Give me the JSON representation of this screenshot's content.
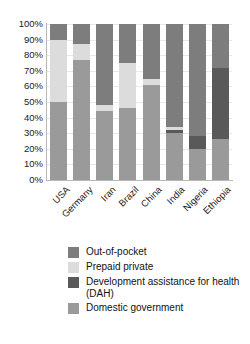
{
  "chart_data": {
    "type": "bar",
    "subtype": "stacked-bar-100",
    "title": "",
    "subtitle": "",
    "xlabel": "",
    "ylabel": "",
    "ylim": [
      0,
      100
    ],
    "yunit": "%",
    "grid": true,
    "legend_position": "bottom-left",
    "categories": [
      "USA",
      "Germany",
      "Iran",
      "Brazil",
      "China",
      "India",
      "Nigeria",
      "Ethiopia"
    ],
    "ytick_labels": [
      "100%",
      "90%",
      "80%",
      "70%",
      "60%",
      "50%",
      "40%",
      "30%",
      "20%",
      "10%",
      "0%"
    ],
    "ytick_values": [
      100,
      90,
      80,
      70,
      60,
      50,
      40,
      30,
      20,
      10,
      0
    ],
    "stack_order_bottom_to_top": [
      "Domestic government",
      "Development assistance for health (DAH)",
      "Prepaid private",
      "Out-of-pocket"
    ],
    "series": [
      {
        "name": "Domestic government",
        "color": "#9a9a9a",
        "values": [
          50,
          77,
          44,
          46,
          61,
          30,
          20,
          26
        ]
      },
      {
        "name": "Development assistance for health (DAH)",
        "color": "#595959",
        "values": [
          0,
          0,
          0,
          0,
          0,
          2,
          8,
          46
        ]
      },
      {
        "name": "Prepaid private",
        "color": "#dcdcdc",
        "values": [
          40,
          10,
          4,
          29,
          4,
          2,
          0,
          0
        ]
      },
      {
        "name": "Out-of-pocket",
        "color": "#7d7d7d",
        "values": [
          10,
          13,
          52,
          25,
          35,
          66,
          72,
          28
        ]
      }
    ]
  },
  "legend": {
    "items": [
      {
        "label": "Out-of-pocket",
        "color": "#7d7d7d",
        "icon": "legend-swatch-icon"
      },
      {
        "label": "Prepaid private",
        "color": "#dcdcdc",
        "icon": "legend-swatch-icon"
      },
      {
        "label": "Development assistance for health (DAH)",
        "color": "#595959",
        "icon": "legend-swatch-icon"
      },
      {
        "label": "Domestic government",
        "color": "#9a9a9a",
        "icon": "legend-swatch-icon"
      }
    ]
  }
}
